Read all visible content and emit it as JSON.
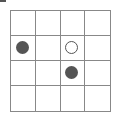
{
  "board": {
    "rows": 4,
    "cols": 4,
    "line_color": "#888888",
    "stones": [
      {
        "row": 1,
        "col": 0,
        "type": "filled",
        "color": "#555555"
      },
      {
        "row": 1,
        "col": 2,
        "type": "open",
        "color": "#555555"
      },
      {
        "row": 2,
        "col": 2,
        "type": "filled",
        "color": "#555555"
      }
    ]
  }
}
